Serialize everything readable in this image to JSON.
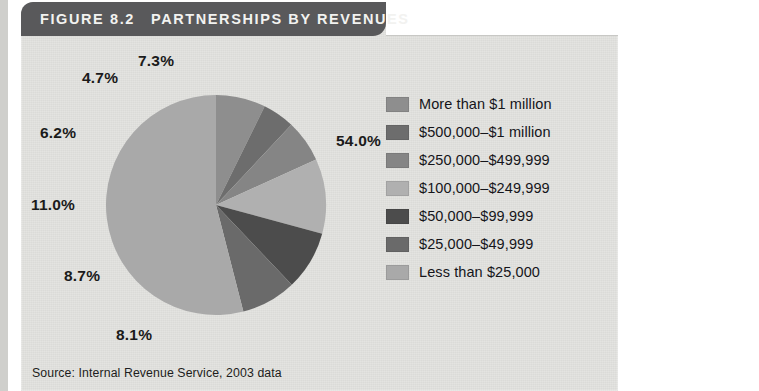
{
  "figure": {
    "number_label": "FIGURE 8.2",
    "title": "PARTNERSHIPS BY REVENUES",
    "source": "Source: Internal Revenue Service, 2003 data",
    "header_bg": "#59595b",
    "panel_bg": "#e3e3e0"
  },
  "chart_data": {
    "type": "pie",
    "title": "Partnerships by Revenues",
    "unit": "percent",
    "legend_position": "right",
    "categories": [
      "More than $1 million",
      "$500,000–$1 million",
      "$250,000–$499,999",
      "$100,000–$249,999",
      "$50,000–$99,999",
      "$25,000–$49,999",
      "Less than $25,000"
    ],
    "values": [
      7.3,
      4.7,
      6.2,
      11.0,
      8.7,
      8.1,
      54.0
    ],
    "colors": [
      "#8e8e8e",
      "#6d6d6d",
      "#858585",
      "#b0b0b0",
      "#4c4c4c",
      "#6a6a6a",
      "#a9a9a9"
    ],
    "labels": [
      "7.3%",
      "4.7%",
      "6.2%",
      "11.0%",
      "8.7%",
      "8.1%",
      "54.0%"
    ],
    "slices": [
      {
        "label": "More than $1 million",
        "value": 7.3,
        "display": "7.3%",
        "color": "#8e8e8e"
      },
      {
        "label": "$500,000–$1 million",
        "value": 4.7,
        "display": "4.7%",
        "color": "#6d6d6d"
      },
      {
        "label": "$250,000–$499,999",
        "value": 6.2,
        "display": "6.2%",
        "color": "#858585"
      },
      {
        "label": "$100,000–$249,999",
        "value": 11.0,
        "display": "11.0%",
        "color": "#b0b0b0"
      },
      {
        "label": "$50,000–$99,999",
        "value": 8.7,
        "display": "8.7%",
        "color": "#4c4c4c"
      },
      {
        "label": "$25,000–$49,999",
        "value": 8.1,
        "display": "8.1%",
        "color": "#6a6a6a"
      },
      {
        "label": "Less than $25,000",
        "value": 54.0,
        "display": "54.0%",
        "color": "#a9a9a9"
      }
    ]
  },
  "legend": {
    "items": [
      {
        "label": "More than $1 million",
        "color": "#8e8e8e"
      },
      {
        "label": "$500,000–$1 million",
        "color": "#6d6d6d"
      },
      {
        "label": "$250,000–$499,999",
        "color": "#858585"
      },
      {
        "label": "$100,000–$249,999",
        "color": "#b0b0b0"
      },
      {
        "label": "$50,000–$99,999",
        "color": "#4c4c4c"
      },
      {
        "label": "$25,000–$49,999",
        "color": "#6a6a6a"
      },
      {
        "label": "Less than $25,000",
        "color": "#a9a9a9"
      }
    ]
  },
  "sidebar": {
    "text_before": "The majority of ",
    "bold_word": "partnerships",
    "text_after": " are quite small, making less than $25,000 in sales during a year. However, close to 20 percent of partnerships take in yearly rev-enues in excess of $250,000."
  }
}
